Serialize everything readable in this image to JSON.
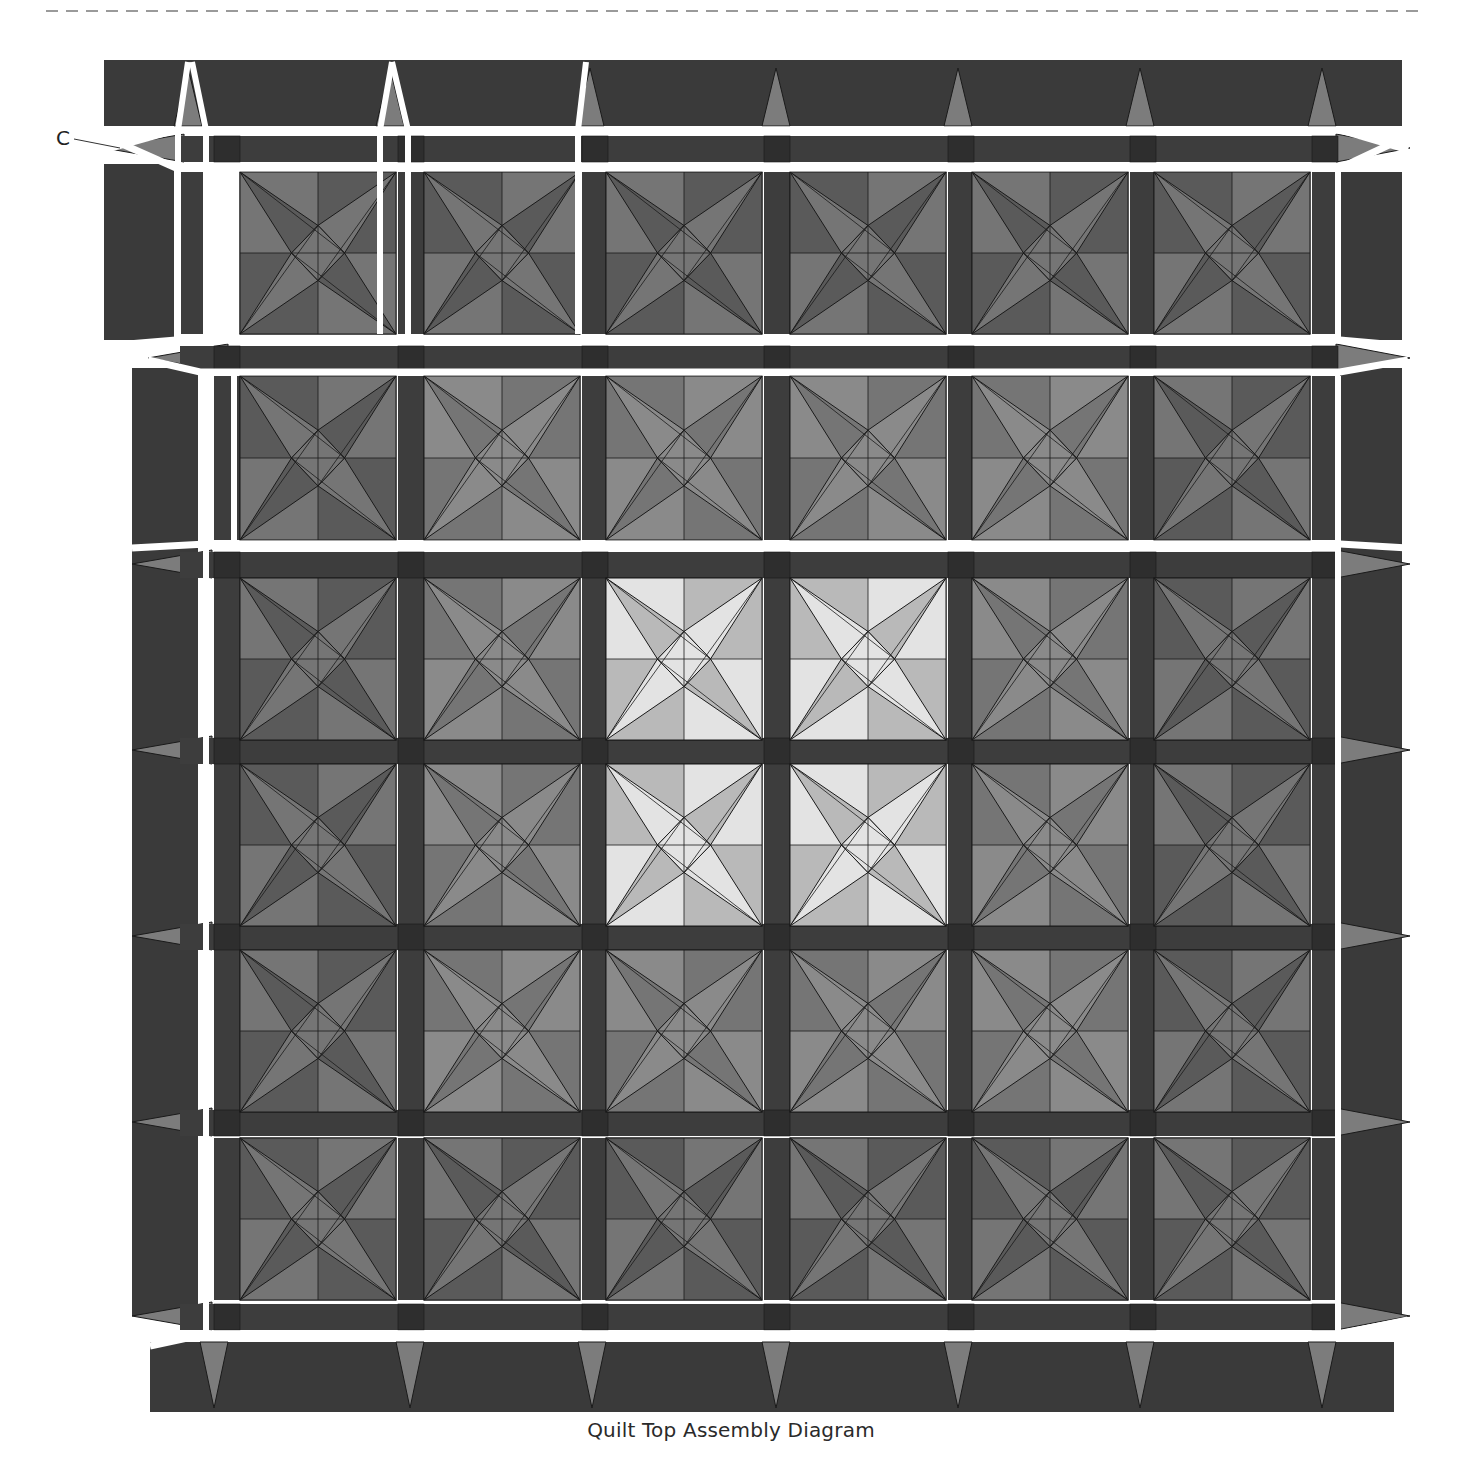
{
  "caption": "Quilt Top Assembly Diagram",
  "callouts": [
    {
      "label": "C",
      "target": "top-left border triangle"
    }
  ],
  "colors": {
    "background": "#ffffff",
    "dashed_rule": "#9a9a9a",
    "border_dark": "#3a3a3a",
    "sashing": "#3d3d3d",
    "cornerstone": "#2e2e2e",
    "border_point": "#7c7c7c",
    "block_dark": "#5a5a5a",
    "block_medium": "#757575",
    "block_light_a": "#b9b9b9",
    "block_light_b": "#e3e3e3",
    "seam_gap": "#ffffff",
    "outline": "#1a1a1a"
  },
  "layout": {
    "columns_x": [
      240,
      424,
      606,
      790,
      972,
      1154
    ],
    "block_size": 156,
    "rows": [
      {
        "y": 172,
        "h": 162,
        "gapped_cols": 3
      },
      {
        "y": 376,
        "h": 164,
        "gapped_cols": 0
      },
      {
        "y": 578,
        "h": 162,
        "gapped_cols": 0
      },
      {
        "y": 764,
        "h": 162,
        "gapped_cols": 0
      },
      {
        "y": 950,
        "h": 162,
        "gapped_cols": 0
      },
      {
        "y": 1138,
        "h": 162,
        "gapped_cols": 0
      }
    ]
  },
  "blocks": [
    [
      "dark",
      "dark",
      "dark",
      "dark",
      "dark",
      "dark"
    ],
    [
      "dark",
      "medium",
      "medium",
      "medium",
      "medium",
      "dark"
    ],
    [
      "dark",
      "medium",
      "light",
      "light",
      "medium",
      "dark"
    ],
    [
      "dark",
      "medium",
      "light",
      "light",
      "medium",
      "dark"
    ],
    [
      "dark",
      "medium",
      "medium",
      "medium",
      "medium",
      "dark"
    ],
    [
      "dark",
      "dark",
      "dark",
      "dark",
      "dark",
      "dark"
    ]
  ]
}
